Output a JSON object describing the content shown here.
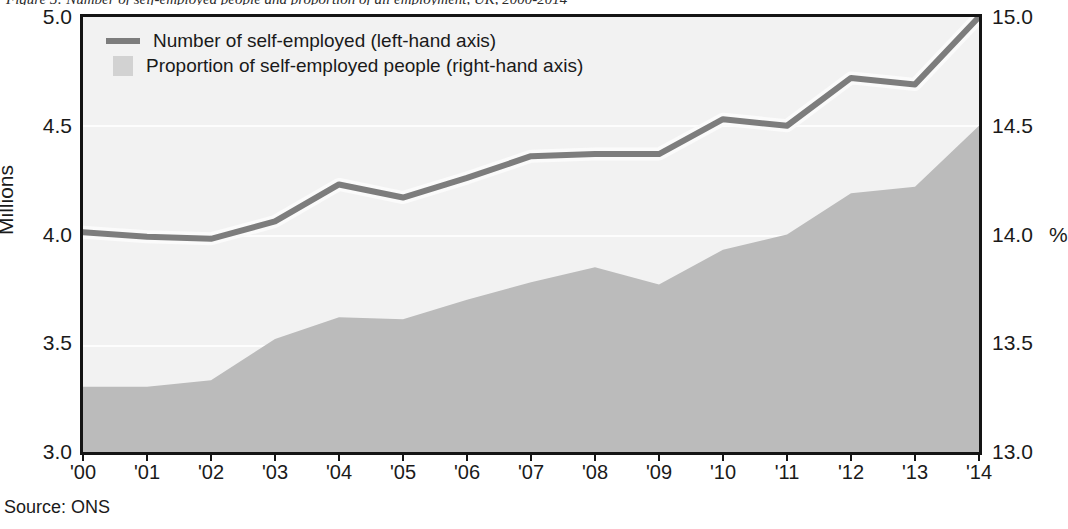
{
  "caption": {
    "text": "Figure 3: Number of self-employed people and proportion of all employment, UK, 2000-2014"
  },
  "source": {
    "label": "Source: ONS"
  },
  "legend": {
    "items": [
      {
        "marker": "line",
        "label": "Number of self-employed (left-hand axis)",
        "color": "#7d7d7d"
      },
      {
        "marker": "square",
        "label": "Proportion of self-employed people (right-hand axis)",
        "color": "#d2d2d2"
      }
    ]
  },
  "axes": {
    "left": {
      "title": "Millions",
      "ticks": [
        "5.0",
        "4.5",
        "4.0",
        "3.5",
        "3.0"
      ]
    },
    "right": {
      "unit": "%",
      "ticks": [
        "15.0",
        "14.5",
        "14.0",
        "13.5",
        "13.0"
      ]
    },
    "x": {
      "ticks": [
        "'00",
        "'01",
        "'02",
        "'03",
        "'04",
        "'05",
        "'06",
        "'07",
        "'08",
        "'09",
        "'10",
        "'11",
        "'12",
        "'13",
        "'14"
      ]
    }
  },
  "colors": {
    "line": "#7d7d7d",
    "line_halo": "#fbfbfb",
    "area_fill": "#bbbbbb",
    "plot_background": "#f2f2f2",
    "frame": "#141414",
    "gridline": "#fdfdfd"
  },
  "bleed_text": [
    {
      "text": "have begun to drive up labour costs. Close to 40 per cent of",
      "x": 300,
      "y": 38,
      "size": 18
    },
    {
      "text": "said they had difficulty to have run out of cash, Come next report",
      "x": 255,
      "y": 70,
      "size": 18
    },
    {
      "text": "on the increased cost of cash, and there has been any demand",
      "x": 265,
      "y": 100,
      "size": 18
    },
    {
      "text": "a sharp increase in Britain since 2009",
      "x": 370,
      "y": 131,
      "size": 18
    },
    {
      "text": "Conventional business growth",
      "x": 420,
      "y": 215,
      "size": 26
    },
    {
      "text": "Businesses has been determined employment survey",
      "x": 320,
      "y": 265,
      "size": 19
    },
    {
      "text": "reported a decline in demand for labour, the need to",
      "x": 310,
      "y": 298,
      "size": 19
    },
    {
      "text": "in the next quarter of those who have recent",
      "x": 330,
      "y": 330,
      "size": 19
    }
  ],
  "chart_data": {
    "type": "line",
    "title": "",
    "xlabel": "",
    "ylabel": "Millions",
    "x": [
      "'00",
      "'01",
      "'02",
      "'03",
      "'04",
      "'05",
      "'06",
      "'07",
      "'08",
      "'09",
      "'10",
      "'11",
      "'12",
      "'13",
      "'14"
    ],
    "grid": true,
    "legend_position": "top-left",
    "series": [
      {
        "name": "Number of self-employed (left-hand axis)",
        "render": "line",
        "axis": "left",
        "unit": "millions",
        "color": "#7d7d7d",
        "values": [
          4.01,
          3.99,
          3.98,
          4.06,
          4.23,
          4.17,
          4.26,
          4.36,
          4.37,
          4.37,
          4.53,
          4.5,
          4.72,
          4.69,
          5.0
        ]
      },
      {
        "name": "Proportion of self-employed people (right-hand axis)",
        "render": "area",
        "axis": "right",
        "unit": "%",
        "color": "#bbbbbb",
        "values": [
          13.3,
          13.3,
          13.33,
          13.52,
          13.62,
          13.61,
          13.7,
          13.78,
          13.85,
          13.77,
          13.93,
          14.0,
          14.19,
          14.22,
          14.5
        ]
      }
    ],
    "ylim_left": [
      3.0,
      5.0
    ],
    "ylim_right": [
      13.0,
      15.0
    ],
    "yticks_left": [
      3.0,
      3.5,
      4.0,
      4.5,
      5.0
    ],
    "yticks_right": [
      13.0,
      13.5,
      14.0,
      14.5,
      15.0
    ]
  }
}
